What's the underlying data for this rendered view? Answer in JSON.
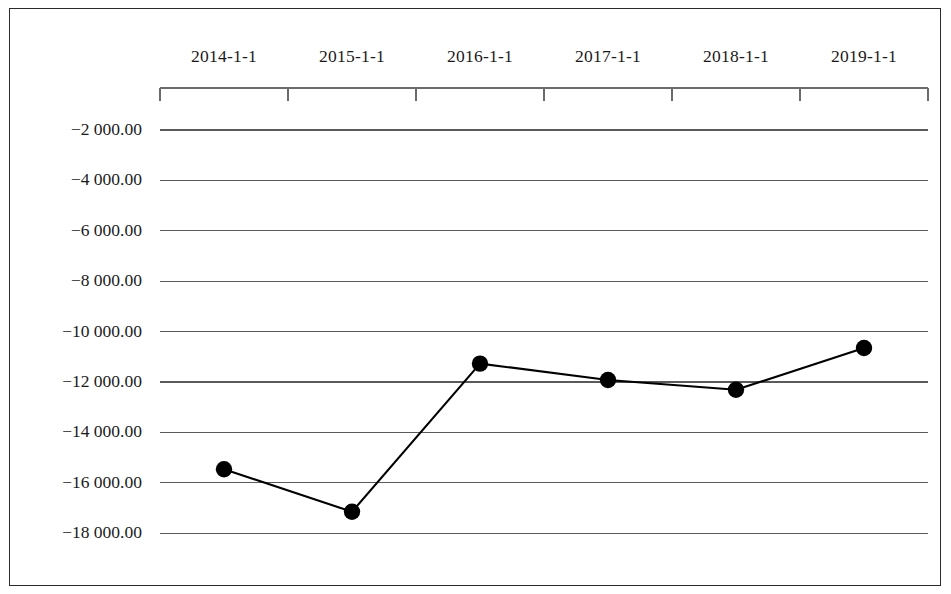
{
  "chart_data": {
    "type": "line",
    "title": "",
    "subtitle": "",
    "xlabel": "",
    "ylabel": "",
    "categories": [
      "2014-1-1",
      "2015-1-1",
      "2016-1-1",
      "2017-1-1",
      "2018-1-1",
      "2019-1-1"
    ],
    "values": [
      -15460.0,
      -17150.0,
      -11270.0,
      -11920.0,
      -12310.0,
      -10650.0
    ],
    "series": [
      {
        "name": "",
        "values": [
          -15460.0,
          -17150.0,
          -11270.0,
          -11920.0,
          -12310.0,
          -10650.0
        ]
      }
    ],
    "y_tick_labels": [
      "-2 000.00",
      "-4 000.00",
      "-6 000.00",
      "-8 000.00",
      "-10 000.00",
      "-12 000.00",
      "-14 000.00",
      "-16 000.00",
      "-18 000.00"
    ],
    "y_tick_values": [
      -2000,
      -4000,
      -6000,
      -8000,
      -10000,
      -12000,
      -14000,
      -16000,
      -18000
    ],
    "ylim": [
      -19000,
      -1000
    ],
    "grid": true,
    "grid_axis": "y",
    "legend": "none",
    "x_axis_position": "top",
    "marker": "circle",
    "marker_color": "#000000",
    "line_color": "#000000",
    "grid_color": "#5a5a5a",
    "axis_color": "#6b6b6b",
    "frame_color": "#2b2b2b"
  }
}
